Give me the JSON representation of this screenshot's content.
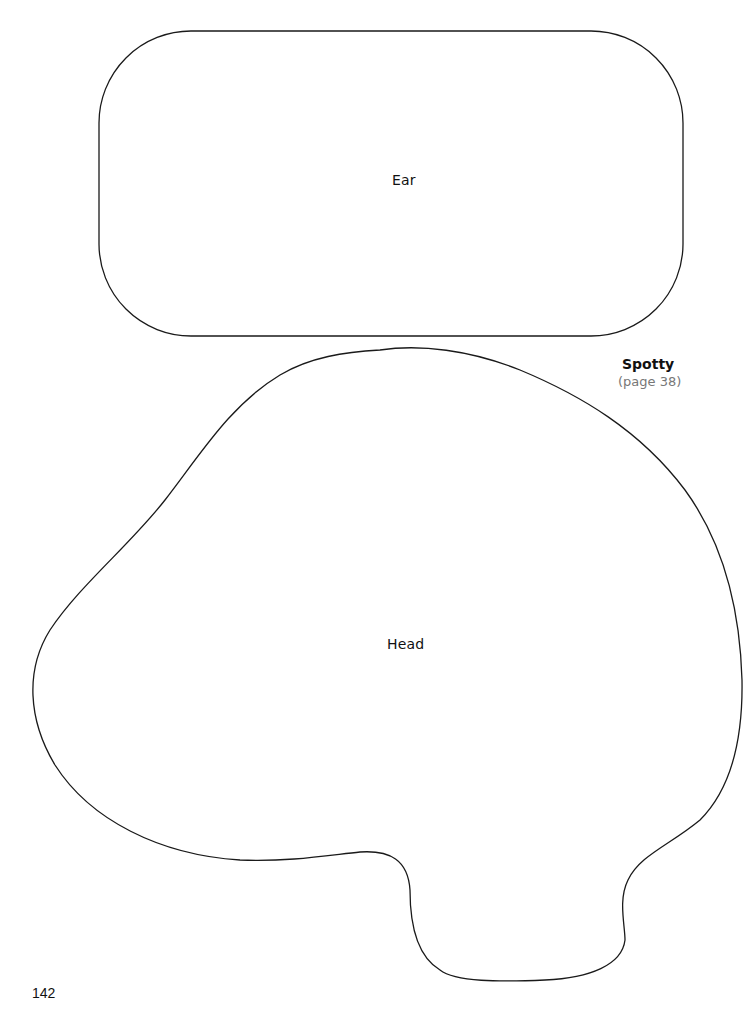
{
  "document": {
    "page_number": "142",
    "project": {
      "title": "Spotty",
      "page_reference": "(page 38)"
    },
    "pattern_pieces": [
      {
        "name": "ear",
        "label": "Ear",
        "shape": "rounded-rectangle"
      },
      {
        "name": "head",
        "label": "Head",
        "shape": "freeform-outline"
      }
    ],
    "colors": {
      "outline": "#1a1a1a",
      "text": "#111111",
      "reference_text": "#777777",
      "background": "#ffffff"
    }
  }
}
